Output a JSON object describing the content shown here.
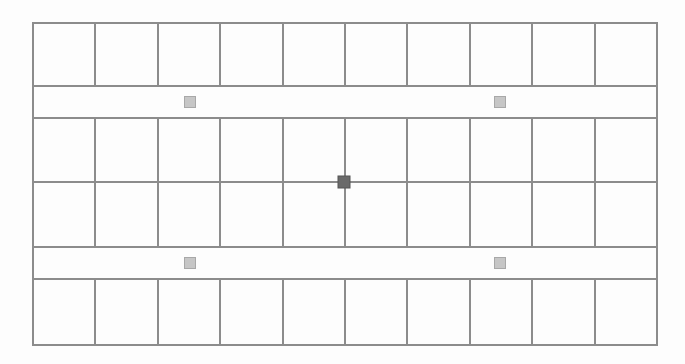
{
  "diagram": {
    "type": "grid-layout",
    "bounds": {
      "left": 33,
      "top": 23,
      "right": 657,
      "bottom": 345
    },
    "columns": 10,
    "row_lines_y": [
      23,
      86,
      118,
      182,
      247,
      279,
      345
    ],
    "rows": [
      {
        "kind": "cells",
        "y0": 23,
        "y1": 86
      },
      {
        "kind": "strip",
        "y0": 86,
        "y1": 118
      },
      {
        "kind": "cells",
        "y0": 118,
        "y1": 182
      },
      {
        "kind": "cells",
        "y0": 182,
        "y1": 247
      },
      {
        "kind": "strip",
        "y0": 247,
        "y1": 279
      },
      {
        "kind": "cells",
        "y0": 279,
        "y1": 345
      }
    ],
    "markers": [
      {
        "name": "marker-top-left",
        "cx": 190,
        "cy": 102,
        "size": 11,
        "kind": "light"
      },
      {
        "name": "marker-top-right",
        "cx": 500,
        "cy": 102,
        "size": 11,
        "kind": "light"
      },
      {
        "name": "marker-center",
        "cx": 344,
        "cy": 182,
        "size": 12,
        "kind": "dark"
      },
      {
        "name": "marker-bottom-left",
        "cx": 190,
        "cy": 263,
        "size": 11,
        "kind": "light"
      },
      {
        "name": "marker-bottom-right",
        "cx": 500,
        "cy": 263,
        "size": 11,
        "kind": "light"
      }
    ],
    "colors": {
      "line": "#8c8c8c",
      "background": "#fdfdfd",
      "marker_light_fill": "#c6c6c6",
      "marker_light_stroke": "#a8a8a8",
      "marker_dark_fill": "#6a6a6a",
      "marker_dark_stroke": "#555555"
    }
  }
}
